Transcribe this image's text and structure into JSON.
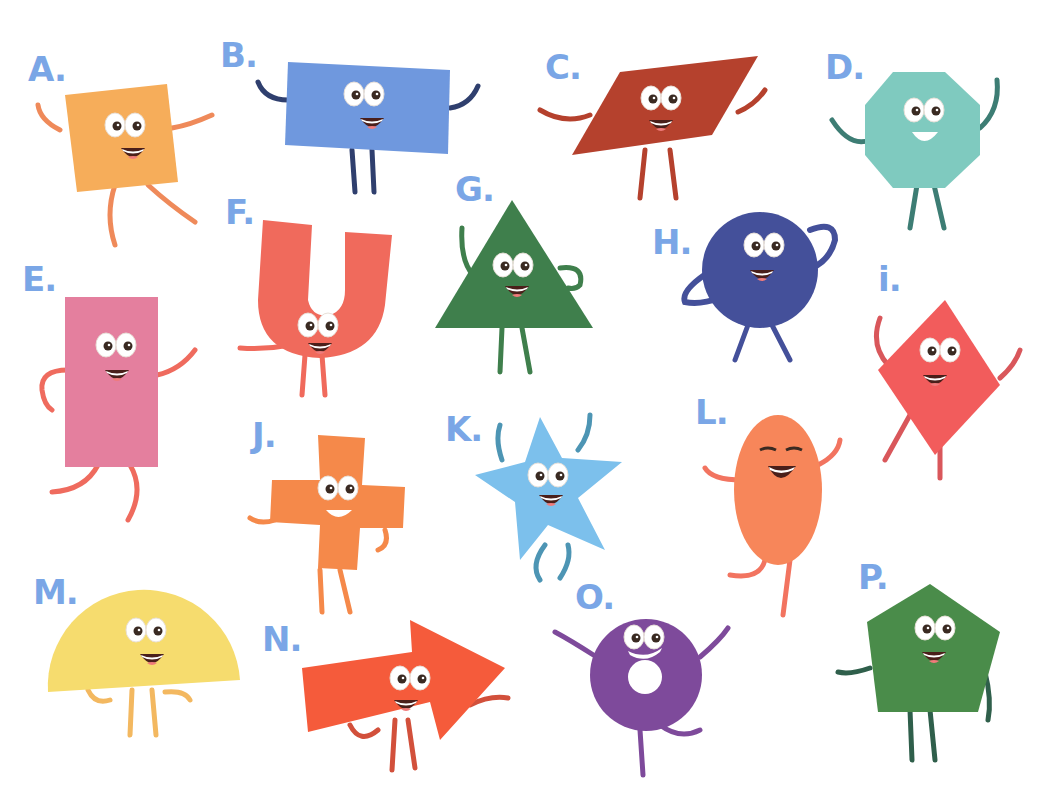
{
  "worksheet": {
    "background": "#ffffff",
    "label_color": "#7aa6e6",
    "characters": [
      {
        "letter": "A.",
        "shape": "square",
        "color": "#f6ad5a",
        "limb": "#ef8a5a",
        "label_pos": [
          28,
          52
        ]
      },
      {
        "letter": "B.",
        "shape": "rectangle",
        "color": "#6f98de",
        "limb": "#2f3f6e",
        "label_pos": [
          220,
          38
        ]
      },
      {
        "letter": "C.",
        "shape": "parallelogram",
        "color": "#b5412d",
        "limb": "#b5412d",
        "label_pos": [
          545,
          50
        ]
      },
      {
        "letter": "D.",
        "shape": "octagon",
        "color": "#7fcabf",
        "limb": "#3d7d74",
        "label_pos": [
          825,
          50
        ]
      },
      {
        "letter": "E.",
        "shape": "rectangle",
        "color": "#e47f9e",
        "limb": "#ef6b5e",
        "label_pos": [
          22,
          262
        ]
      },
      {
        "letter": "F.",
        "shape": "u-shape",
        "color": "#f06a5c",
        "limb": "#f06a5c",
        "label_pos": [
          225,
          195
        ]
      },
      {
        "letter": "G.",
        "shape": "triangle",
        "color": "#3f7f4c",
        "limb": "#3f7f4c",
        "label_pos": [
          455,
          172
        ]
      },
      {
        "letter": "H.",
        "shape": "circle",
        "color": "#44509a",
        "limb": "#44509a",
        "label_pos": [
          652,
          225
        ]
      },
      {
        "letter": "i.",
        "shape": "rhombus",
        "color": "#f25c5c",
        "limb": "#d9575b",
        "label_pos": [
          878,
          262
        ]
      },
      {
        "letter": "J.",
        "shape": "cross",
        "color": "#f5894a",
        "limb": "#f5894a",
        "label_pos": [
          252,
          418
        ]
      },
      {
        "letter": "K.",
        "shape": "star",
        "color": "#7cc0ec",
        "limb": "#4d95b4",
        "label_pos": [
          445,
          412
        ]
      },
      {
        "letter": "L.",
        "shape": "oval",
        "color": "#f7865a",
        "limb": "#f27460",
        "label_pos": [
          695,
          395
        ]
      },
      {
        "letter": "M.",
        "shape": "semicircle",
        "color": "#f6dc6e",
        "limb": "#f3b860",
        "label_pos": [
          33,
          575
        ]
      },
      {
        "letter": "N.",
        "shape": "arrow",
        "color": "#f55b3b",
        "limb": "#d2503b",
        "label_pos": [
          262,
          622
        ]
      },
      {
        "letter": "O.",
        "shape": "ring",
        "color": "#7e4a9b",
        "limb": "#7e4a9b",
        "label_pos": [
          575,
          580
        ]
      },
      {
        "letter": "P.",
        "shape": "pentagon",
        "color": "#4a8c4a",
        "limb": "#2f5f4b",
        "label_pos": [
          858,
          560
        ]
      }
    ]
  }
}
